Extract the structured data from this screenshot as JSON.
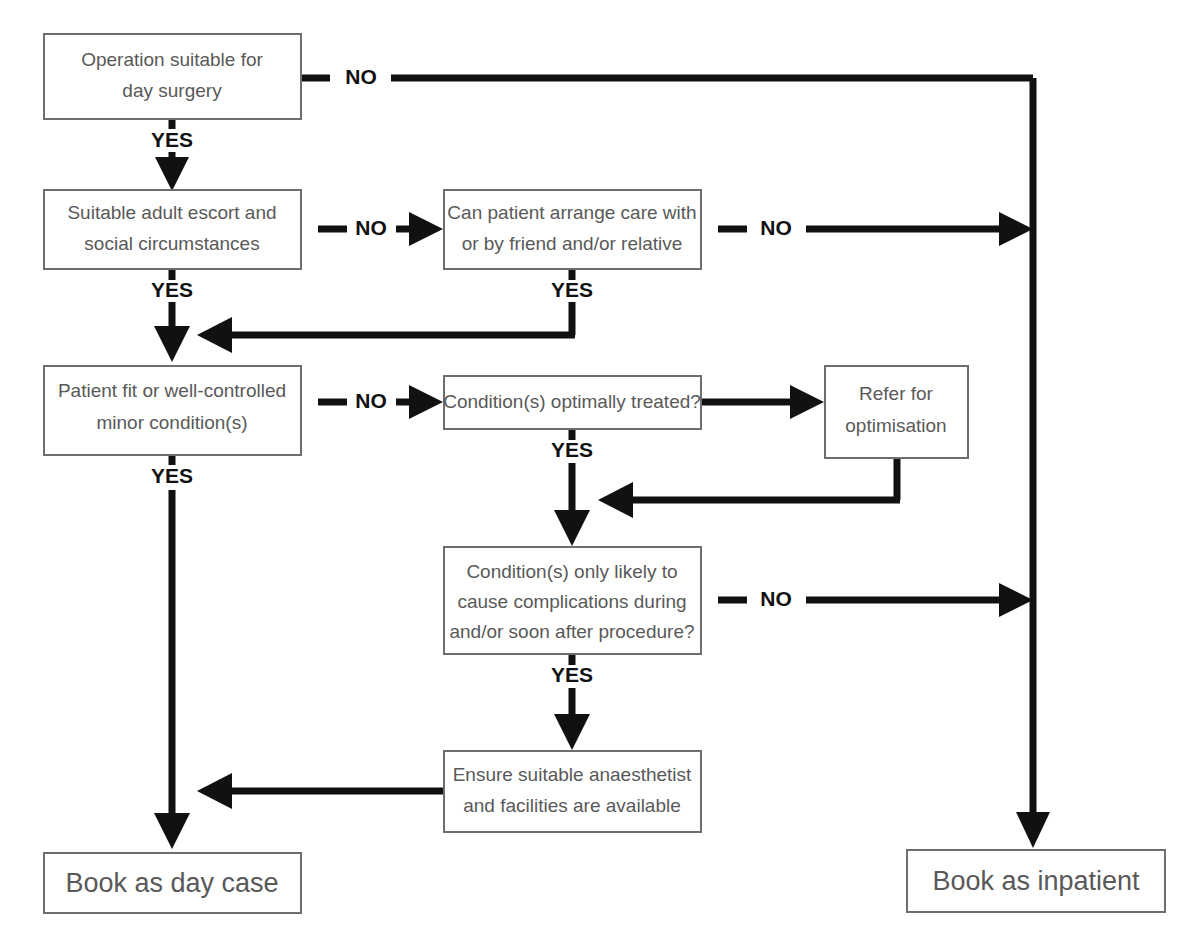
{
  "diagram": {
    "colors": {
      "box_stroke": "#6e6e6e",
      "box_fill": "#ffffff",
      "node_text": "#595959",
      "connector": "#111111",
      "label_text": "#111111",
      "background": "#ffffff"
    },
    "nodes": {
      "operation_suitable": {
        "id": "operation-suitable-box",
        "lines": [
          "Operation suitable for",
          "day surgery"
        ]
      },
      "escort_social": {
        "id": "escort-social-box",
        "lines": [
          "Suitable adult escort and",
          "social circumstances"
        ]
      },
      "arrange_care": {
        "id": "arrange-care-box",
        "lines": [
          "Can patient arrange care with",
          "or by friend and/or relative"
        ]
      },
      "patient_fit": {
        "id": "patient-fit-box",
        "lines": [
          "Patient fit or well-controlled",
          "minor condition(s)"
        ]
      },
      "optimally_treated": {
        "id": "optimally-treated-box",
        "lines": [
          "Condition(s) optimally treated?"
        ]
      },
      "refer_optimisation": {
        "id": "refer-optimisation-box",
        "lines": [
          "Refer for",
          "optimisation"
        ]
      },
      "complications": {
        "id": "complications-box",
        "lines": [
          "Condition(s) only likely to",
          "cause complications during",
          "and/or soon after procedure?"
        ]
      },
      "ensure_anaesthetist": {
        "id": "ensure-anaesthetist-box",
        "lines": [
          "Ensure suitable anaesthetist",
          "and facilities are available"
        ]
      },
      "book_day_case": {
        "id": "book-day-case-box",
        "lines": [
          "Book as day case"
        ]
      },
      "book_inpatient": {
        "id": "book-inpatient-box",
        "lines": [
          "Book as inpatient"
        ]
      }
    },
    "edge_labels": {
      "no_operation": "NO",
      "yes_operation": "YES",
      "no_escort": "NO",
      "yes_escort": "YES",
      "no_arrange_care": "NO",
      "yes_arrange_care": "YES",
      "no_patient_fit": "NO",
      "yes_patient_fit": "YES",
      "yes_optimally_treated": "YES",
      "no_complications": "NO",
      "yes_complications": "YES"
    }
  }
}
